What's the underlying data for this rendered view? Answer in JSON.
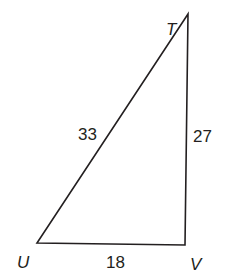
{
  "diagram": {
    "type": "triangle",
    "vertices": {
      "T": {
        "label": "T"
      },
      "U": {
        "label": "U"
      },
      "V": {
        "label": "V"
      }
    },
    "sides": {
      "TU": {
        "label": "33"
      },
      "TV": {
        "label": "27"
      },
      "UV": {
        "label": "18"
      }
    },
    "colors": {
      "stroke": "#231f20",
      "background": "#ffffff"
    }
  }
}
